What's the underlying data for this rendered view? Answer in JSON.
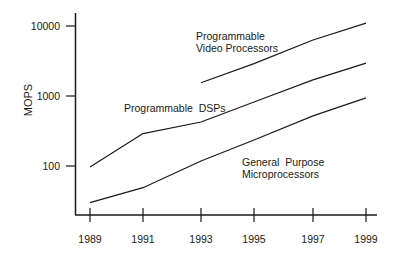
{
  "chart_data": {
    "type": "line",
    "title": "",
    "xlabel": "",
    "ylabel": "MOPS",
    "yscale": "log",
    "ylim": [
      20,
      13000
    ],
    "grid": false,
    "legend_position": "inline labels",
    "x": [
      1989,
      1991,
      1993,
      1995,
      1997,
      1999
    ],
    "xticks": [
      "1989",
      "1991",
      "1993",
      "1995",
      "1997",
      "1999"
    ],
    "yticks": [
      {
        "value": 100,
        "label": "100"
      },
      {
        "value": 1000,
        "label": "1000"
      },
      {
        "value": 10000,
        "label": "10000"
      }
    ],
    "series": [
      {
        "name": "Programmable Video Processors",
        "label_lines": [
          "Programmable",
          "Video Processors"
        ],
        "x": [
          1993,
          1995,
          1997,
          1999
        ],
        "values": [
          1550,
          2900,
          6300,
          11000
        ]
      },
      {
        "name": "Programmable DSPs",
        "label_lines": [
          "Programmable  DSPs"
        ],
        "x": [
          1989,
          1991,
          1993,
          1995,
          1997,
          1999
        ],
        "values": [
          97,
          290,
          425,
          820,
          1700,
          2950
        ]
      },
      {
        "name": "General Purpose Microprocessors",
        "label_lines": [
          "General  Purpose",
          "Microprocessors"
        ],
        "x": [
          1989,
          1991,
          1993,
          1995,
          1997,
          1999
        ],
        "values": [
          30,
          49,
          118,
          235,
          520,
          940
        ]
      }
    ]
  },
  "colors": {
    "line": "#1a1a1a",
    "axis": "#1a1a1a",
    "background": "#ffffff"
  }
}
